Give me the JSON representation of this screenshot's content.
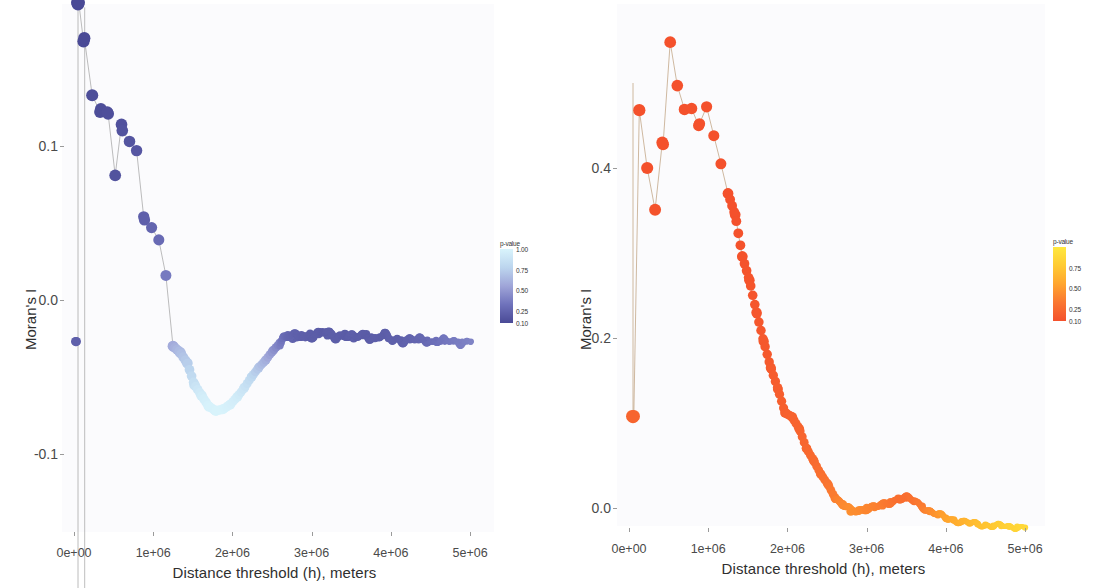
{
  "figure": {
    "panel_count": 2,
    "background": "#fbfbfd"
  },
  "panels": [
    {
      "id": "left",
      "xlabel": "Distance threshold (h), meters",
      "ylabel": "Moran's I",
      "xticks": [
        "0e+00",
        "1e+06",
        "2e+06",
        "3e+06",
        "4e+06",
        "5e+06"
      ],
      "yticks": [
        "0.1",
        "0.0",
        "-0.1"
      ],
      "legend": {
        "title": "p-value",
        "labels": [
          "1.00",
          "0.75",
          "0.50",
          "0.25",
          "0.10"
        ],
        "color_high": "#d6f3fb",
        "color_mid": "#9fa5d8",
        "color_low": "#4f4f9c"
      }
    },
    {
      "id": "right",
      "xlabel": "Distance threshold (h), meters",
      "ylabel": "Moran's I",
      "xticks": [
        "0e+00",
        "1e+06",
        "2e+06",
        "3e+06",
        "4e+06",
        "5e+06"
      ],
      "yticks": [
        "0.4",
        "0.2",
        "0.0"
      ],
      "legend": {
        "title": "p-value",
        "labels": [
          "0.75",
          "0.50",
          "0.25",
          "0.10"
        ],
        "color_high": "#ffe23d",
        "color_mid": "#ffa52e",
        "color_low": "#f4512c"
      }
    }
  ],
  "chart_data": [
    {
      "type": "scatter",
      "title": "",
      "xlabel": "Distance threshold (h), meters",
      "ylabel": "Moran's I",
      "xlim": [
        0,
        5200000
      ],
      "ylim": [
        -0.2,
        0.21
      ],
      "xticks": [
        0,
        1000000,
        2000000,
        3000000,
        4000000,
        5000000
      ],
      "yticks": [
        0.1,
        0.0,
        -0.1
      ],
      "grid": false,
      "legend": {
        "title": "p-value",
        "position": "right",
        "ticks": [
          1.0,
          0.75,
          0.5,
          0.25,
          0.1
        ]
      },
      "colorbar_range": [
        0.1,
        1.0
      ],
      "series": [
        {
          "name": "Moran's I vs distance (left)",
          "x": [
            40000,
            50000,
            60000,
            120000,
            130000,
            230000,
            330000,
            340000,
            420000,
            430000,
            520000,
            600000,
            610000,
            700000,
            790000,
            880000,
            890000,
            980000,
            1070000,
            1160000,
            1250000,
            1340000,
            1430000,
            1520000,
            1610000,
            1700000,
            1790000,
            1880000,
            1970000,
            2060000,
            2150000,
            2240000,
            2330000,
            2420000,
            2510000,
            2600000,
            2650000,
            2700000,
            2760000,
            2810000,
            2870000,
            2920000,
            2980000,
            3030000,
            3090000,
            3140000,
            3200000,
            3250000,
            3310000,
            3360000,
            3420000,
            3470000,
            3530000,
            3580000,
            3640000,
            3690000,
            3750000,
            3800000,
            3860000,
            3910000,
            3970000,
            4020000,
            4080000,
            4130000,
            4190000,
            4240000,
            4300000,
            4350000,
            4410000,
            4460000,
            4520000,
            4570000,
            4630000,
            4680000,
            4740000,
            4790000,
            4850000,
            4900000,
            4960000,
            5010000
          ],
          "y": [
            0.193,
            0.192,
            0.193,
            0.168,
            0.17,
            0.133,
            0.122,
            0.124,
            0.122,
            0.121,
            0.081,
            0.114,
            0.11,
            0.103,
            0.097,
            0.054,
            0.052,
            0.047,
            0.039,
            0.016,
            -0.03,
            -0.034,
            -0.041,
            -0.055,
            -0.062,
            -0.069,
            -0.072,
            -0.071,
            -0.068,
            -0.063,
            -0.057,
            -0.05,
            -0.044,
            -0.039,
            -0.033,
            -0.028,
            -0.024,
            -0.023,
            -0.025,
            -0.024,
            -0.023,
            -0.024,
            -0.022,
            -0.023,
            -0.022,
            -0.021,
            -0.023,
            -0.022,
            -0.024,
            -0.023,
            -0.022,
            -0.024,
            -0.025,
            -0.024,
            -0.023,
            -0.022,
            -0.024,
            -0.025,
            -0.024,
            -0.023,
            -0.025,
            -0.026,
            -0.025,
            -0.026,
            -0.026,
            -0.026,
            -0.026,
            -0.026,
            -0.026,
            -0.026,
            -0.027,
            -0.026,
            -0.027,
            -0.027,
            -0.027,
            -0.027,
            -0.027,
            -0.027,
            -0.027,
            -0.027
          ],
          "p": [
            0.1,
            0.1,
            0.1,
            0.1,
            0.1,
            0.12,
            0.12,
            0.12,
            0.13,
            0.13,
            0.15,
            0.14,
            0.15,
            0.16,
            0.17,
            0.22,
            0.22,
            0.25,
            0.28,
            0.36,
            0.58,
            0.66,
            0.74,
            0.86,
            0.94,
            0.98,
            0.99,
            0.99,
            0.97,
            0.94,
            0.88,
            0.8,
            0.7,
            0.6,
            0.48,
            0.38,
            0.3,
            0.26,
            0.24,
            0.23,
            0.22,
            0.22,
            0.21,
            0.21,
            0.21,
            0.2,
            0.21,
            0.21,
            0.21,
            0.21,
            0.2,
            0.21,
            0.22,
            0.21,
            0.21,
            0.2,
            0.21,
            0.22,
            0.21,
            0.21,
            0.22,
            0.23,
            0.22,
            0.23,
            0.24,
            0.24,
            0.25,
            0.26,
            0.27,
            0.28,
            0.3,
            0.31,
            0.33,
            0.34,
            0.35,
            0.36,
            0.37,
            0.38,
            0.39,
            0.4
          ]
        }
      ],
      "extra_points": [
        {
          "x": 20000,
          "y": -0.027,
          "p": 0.22,
          "note": "left-edge cluster"
        },
        {
          "x": 30000,
          "y": -0.027,
          "p": 0.22,
          "note": "left-edge cluster"
        },
        {
          "x": 135000,
          "y": -0.196,
          "p": 0.95,
          "note": "low outlier"
        }
      ]
    },
    {
      "type": "scatter",
      "title": "",
      "xlabel": "Distance threshold (h), meters",
      "ylabel": "Moran's I",
      "xlim": [
        0,
        5200000
      ],
      "ylim": [
        -0.07,
        0.58
      ],
      "xticks": [
        0,
        1000000,
        2000000,
        3000000,
        4000000,
        5000000
      ],
      "yticks": [
        0.4,
        0.2,
        0.0
      ],
      "grid": false,
      "legend": {
        "title": "p-value",
        "position": "right",
        "ticks": [
          0.75,
          0.5,
          0.25,
          0.1
        ]
      },
      "colorbar_range": [
        0.1,
        1.0
      ],
      "series": [
        {
          "name": "Moran's I vs distance (right)",
          "x": [
            40000,
            50000,
            60000,
            130000,
            230000,
            330000,
            420000,
            430000,
            520000,
            610000,
            700000,
            790000,
            880000,
            890000,
            980000,
            1070000,
            1160000,
            1250000,
            1340000,
            1430000,
            1520000,
            1610000,
            1700000,
            1790000,
            1880000,
            1970000,
            2060000,
            2150000,
            2240000,
            2330000,
            2420000,
            2510000,
            2600000,
            2700000,
            2800000,
            2900000,
            3000000,
            3100000,
            3200000,
            3300000,
            3400000,
            3500000,
            3600000,
            3700000,
            3800000,
            3900000,
            4000000,
            4100000,
            4200000,
            4300000,
            4400000,
            4500000,
            4600000,
            4700000,
            4800000,
            4900000,
            5000000
          ],
          "y": [
            0.108,
            0.107,
            0.108,
            0.468,
            0.4,
            0.351,
            0.43,
            0.428,
            0.548,
            0.497,
            0.469,
            0.47,
            0.45,
            0.452,
            0.472,
            0.438,
            0.405,
            0.37,
            0.345,
            0.296,
            0.268,
            0.23,
            0.196,
            0.165,
            0.14,
            0.112,
            0.107,
            0.093,
            0.07,
            0.056,
            0.04,
            0.028,
            0.012,
            0.004,
            -0.004,
            -0.003,
            0.0,
            0.001,
            0.003,
            0.007,
            0.011,
            0.012,
            0.008,
            0.002,
            -0.004,
            -0.008,
            -0.012,
            -0.014,
            -0.016,
            -0.018,
            -0.019,
            -0.02,
            -0.021,
            -0.021,
            -0.022,
            -0.022,
            -0.023
          ],
          "p": [
            0.22,
            0.22,
            0.22,
            0.1,
            0.1,
            0.11,
            0.1,
            0.1,
            0.1,
            0.1,
            0.1,
            0.1,
            0.1,
            0.1,
            0.1,
            0.1,
            0.1,
            0.1,
            0.1,
            0.11,
            0.12,
            0.13,
            0.14,
            0.16,
            0.17,
            0.19,
            0.2,
            0.21,
            0.23,
            0.25,
            0.28,
            0.31,
            0.36,
            0.41,
            0.44,
            0.43,
            0.4,
            0.38,
            0.35,
            0.32,
            0.28,
            0.27,
            0.3,
            0.35,
            0.42,
            0.48,
            0.54,
            0.58,
            0.62,
            0.66,
            0.7,
            0.73,
            0.76,
            0.79,
            0.82,
            0.85,
            0.88
          ]
        }
      ],
      "extra_points": []
    }
  ]
}
